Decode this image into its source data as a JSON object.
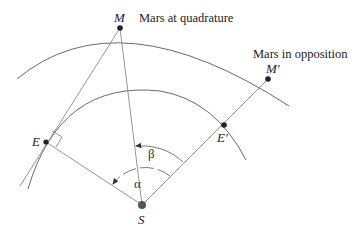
{
  "diagram": {
    "labels": {
      "M": "M",
      "M_prime": "M′",
      "E": "E",
      "E_prime": "E′",
      "S": "S",
      "alpha": "α",
      "beta": "β",
      "mars_quadrature": "Mars at quadrature",
      "mars_opposition": "Mars in opposition"
    },
    "points": {
      "S": [
        142,
        205
      ],
      "M": [
        120,
        28
      ],
      "E": [
        46,
        142
      ],
      "E_prime": [
        224,
        125
      ],
      "M_prime": [
        268,
        79
      ]
    },
    "orbits": [
      {
        "name": "mars-orbit",
        "start": [
          17,
          79
        ],
        "through": [
          120,
          28
        ],
        "end": [
          289,
          106
        ]
      },
      {
        "name": "earth-orbit",
        "start": [
          28,
          189
        ],
        "through": [
          46,
          142
        ],
        "end": [
          246,
          160
        ]
      }
    ],
    "angles": [
      {
        "name": "alpha",
        "vertex": "S",
        "from": "E_prime",
        "to": "E",
        "style": "dashed"
      },
      {
        "name": "beta",
        "vertex": "S",
        "from": "E_prime",
        "to": "M",
        "style": "solid"
      }
    ],
    "colors": {
      "orbit": "#6a6a6a",
      "line": "#8a8a8a",
      "point": "#222222"
    }
  }
}
